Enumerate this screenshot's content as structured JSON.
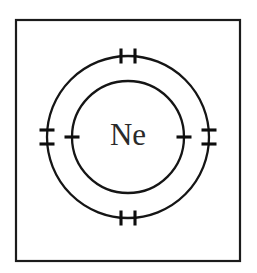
{
  "figure": {
    "kind": "bohr-atomic-model-diagram",
    "element_symbol": "Ne",
    "element_name": "Neon",
    "background_color": "#ffffff",
    "line_color": "#151515",
    "label_color": "#2a2a2a",
    "frame": {
      "x": 16,
      "y": 20,
      "width": 224,
      "height": 241,
      "stroke_color": "#1b1b1b",
      "stroke_width": 2.2,
      "fill": "#ffffff"
    },
    "center": {
      "cx": 128,
      "cy": 137
    },
    "shells": [
      {
        "name": "inner-shell",
        "index": 1,
        "radius": 56,
        "electron_count": 2,
        "stroke_color": "#151515",
        "stroke_width": 2.3,
        "ticks": [
          {
            "name": "inner-shell-electron-left",
            "angle_deg": 180,
            "marks": 1
          },
          {
            "name": "inner-shell-electron-right",
            "angle_deg": 0,
            "marks": 1
          }
        ]
      },
      {
        "name": "outer-shell",
        "index": 2,
        "radius": 81,
        "electron_count": 8,
        "stroke_color": "#151515",
        "stroke_width": 2.3,
        "ticks": [
          {
            "name": "outer-shell-electron-pair-top",
            "angle_deg": 270,
            "marks": 2
          },
          {
            "name": "outer-shell-electron-pair-right",
            "angle_deg": 0,
            "marks": 2
          },
          {
            "name": "outer-shell-electron-pair-bottom",
            "angle_deg": 90,
            "marks": 2
          },
          {
            "name": "outer-shell-electron-pair-left",
            "angle_deg": 180,
            "marks": 2
          }
        ]
      }
    ],
    "tick_geometry": {
      "length": 15,
      "pair_separation": 14,
      "stroke_width": 3.1
    },
    "nucleus_label": {
      "text": "Ne",
      "font_size": 31
    }
  }
}
